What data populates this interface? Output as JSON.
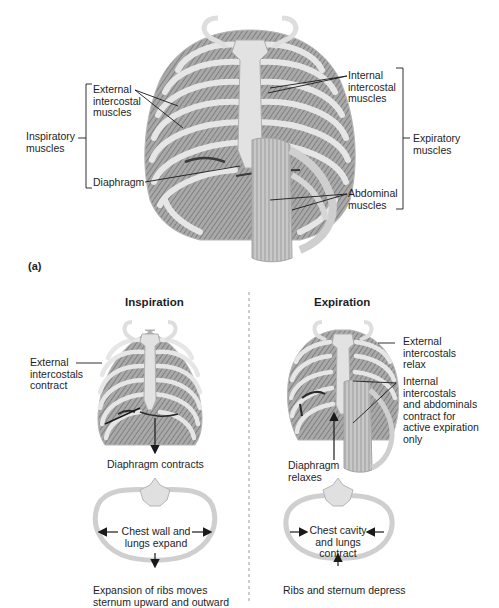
{
  "panel_a": {
    "tag": "(a)",
    "labels": {
      "external_intercostal": "External\nintercostal\nmuscles",
      "inspiratory": "Inspiratory\nmuscles",
      "diaphragm": "Diaphragm",
      "internal_intercostal": "Internal\nintercostal\nmuscles",
      "expiratory": "Expiratory\nmuscles",
      "abdominal": "Abdominal\nmuscles"
    }
  },
  "inspiration": {
    "title": "Inspiration",
    "external_contract": "External\nintercostals\ncontract",
    "diaphragm_contracts": "Diaphragm contracts",
    "chest_expand": "Chest wall and\nlungs expand",
    "caption": "Expansion of ribs moves\nsternum upward and outward"
  },
  "expiration": {
    "title": "Expiration",
    "external_relax": "External\nintercostals\nrelax",
    "internal_contract": "Internal\nintercostals\nand abdominals\ncontract for\nactive expiration\nonly",
    "diaphragm_relaxes": "Diaphragm\nrelaxes",
    "chest_contract": "Chest cavity\nand lungs\ncontract",
    "caption": "Ribs and sternum depress"
  },
  "colors": {
    "bone": "#e4e4e4",
    "bone_edge": "#9a9a9a",
    "muscle": "#8c8c8c",
    "line": "#1a1a1a",
    "divider": "#9a9a9a"
  }
}
